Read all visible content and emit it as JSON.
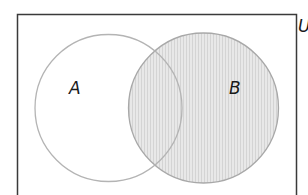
{
  "diagram": {
    "type": "venn",
    "universe_label": "U",
    "sets": [
      {
        "label": "A",
        "shaded": false
      },
      {
        "label": "B",
        "shaded": true
      }
    ],
    "shaded_region": "B",
    "colors": {
      "border": "#3a3a3a",
      "circle_outline": "#a8a8a8",
      "shade_fill": "#e6e6e6",
      "shade_stripe": "#d2d2d2",
      "label": "#1a1a1a"
    }
  }
}
